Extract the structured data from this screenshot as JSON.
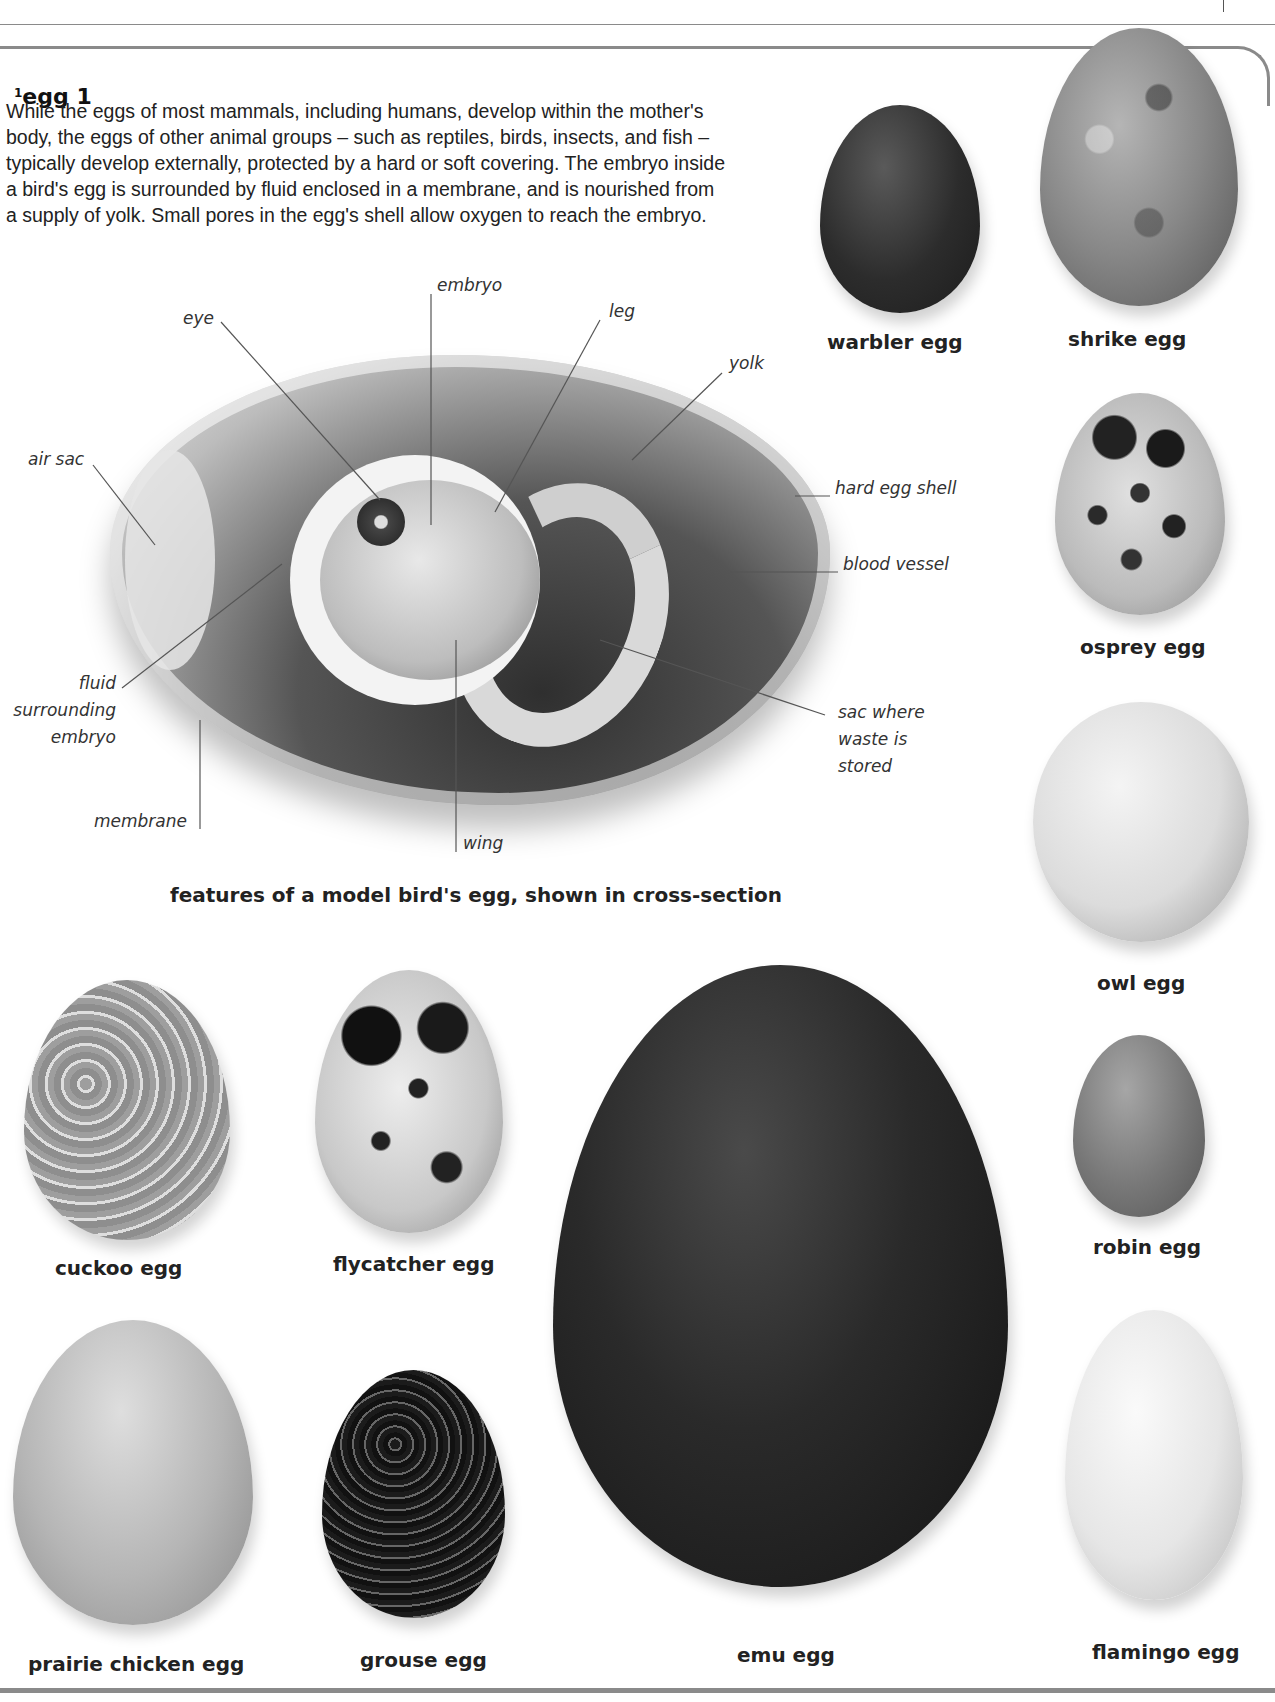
{
  "entry": {
    "superscript": "1",
    "headword": "egg 1",
    "definition": "While the eggs of most mammals, including humans, develop within the mother's body, the eggs of other animal groups – such as reptiles, birds, insects, and fish – typically develop externally, protected by a hard or soft covering. The embryo inside a bird's egg is surrounded by fluid enclosed in a membrane, and is nourished from a supply of yolk. Small pores in the egg's shell allow oxygen to reach the embryo."
  },
  "diagram": {
    "caption": "features of a model bird's egg, shown in cross-section",
    "labels": {
      "embryo": "embryo",
      "eye": "eye",
      "leg": "leg",
      "yolk": "yolk",
      "air_sac": "air sac",
      "hard_egg_shell": "hard egg shell",
      "blood_vessel": "blood vessel",
      "fluid_line1": "fluid",
      "fluid_line2": "surrounding",
      "fluid_line3": "embryo",
      "sac_line1": "sac where",
      "sac_line2": "waste is",
      "sac_line3": "stored",
      "membrane": "membrane",
      "wing": "wing"
    }
  },
  "eggs": {
    "warbler": "warbler egg",
    "shrike": "shrike egg",
    "osprey": "osprey egg",
    "owl": "owl egg",
    "robin": "robin egg",
    "flamingo": "flamingo egg",
    "cuckoo": "cuckoo egg",
    "flycatcher": "flycatcher egg",
    "prairie_chicken": "prairie chicken egg",
    "grouse": "grouse egg",
    "emu": "emu egg"
  },
  "colors": {
    "frame": "#8a8a8a",
    "text": "#222222",
    "leader": "#555555"
  }
}
